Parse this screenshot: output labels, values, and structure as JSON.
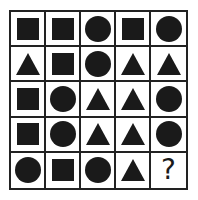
{
  "puzzle": {
    "rows": 5,
    "cols": 5,
    "grid": [
      [
        "square",
        "square",
        "circle",
        "square",
        "circle"
      ],
      [
        "triangle",
        "square",
        "circle",
        "triangle",
        "triangle"
      ],
      [
        "square",
        "circle",
        "triangle",
        "triangle",
        "circle"
      ],
      [
        "square",
        "circle",
        "triangle",
        "triangle",
        "circle"
      ],
      [
        "circle",
        "square",
        "circle",
        "triangle",
        "question"
      ]
    ],
    "missing_symbol": "?"
  },
  "colors": {
    "shape": "#1a1a1a",
    "grid_line": "#222222",
    "background": "#ffffff"
  }
}
